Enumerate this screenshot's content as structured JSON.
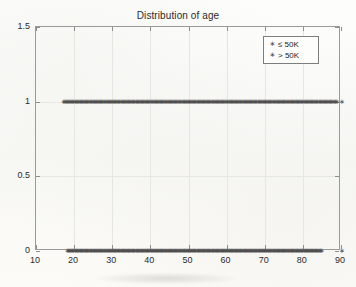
{
  "chart_data": {
    "type": "scatter",
    "title": "Distribution of age",
    "xlabel": "",
    "ylabel": "",
    "xlim": [
      10,
      90
    ],
    "ylim": [
      0,
      1.5
    ],
    "xticks": [
      10,
      20,
      30,
      40,
      50,
      60,
      70,
      80,
      90
    ],
    "yticks": [
      0,
      0.5,
      1,
      1.5
    ],
    "xtick_labels": [
      "10",
      "20",
      "30",
      "40",
      "50",
      "60",
      "70",
      "80",
      "90"
    ],
    "ytick_labels": [
      "0",
      "0.5",
      "1",
      "1.5"
    ],
    "grid": true,
    "legend_position": "top-right",
    "marker": "asterisk",
    "marker_color": "#4c4c4c",
    "series": [
      {
        "name": "≤ 50K",
        "y_value": 1,
        "x": [
          17,
          18,
          19,
          20,
          21,
          22,
          23,
          24,
          25,
          26,
          27,
          28,
          29,
          30,
          31,
          32,
          33,
          34,
          35,
          36,
          37,
          38,
          39,
          40,
          41,
          42,
          43,
          44,
          45,
          46,
          47,
          48,
          49,
          50,
          51,
          52,
          53,
          54,
          55,
          56,
          57,
          58,
          59,
          60,
          61,
          62,
          63,
          64,
          65,
          66,
          67,
          68,
          69,
          70,
          71,
          72,
          73,
          74,
          75,
          76,
          77,
          78,
          79,
          80,
          81,
          82,
          83,
          84,
          85,
          86,
          87,
          88,
          90
        ],
        "values": [
          1,
          1,
          1,
          1,
          1,
          1,
          1,
          1,
          1,
          1,
          1,
          1,
          1,
          1,
          1,
          1,
          1,
          1,
          1,
          1,
          1,
          1,
          1,
          1,
          1,
          1,
          1,
          1,
          1,
          1,
          1,
          1,
          1,
          1,
          1,
          1,
          1,
          1,
          1,
          1,
          1,
          1,
          1,
          1,
          1,
          1,
          1,
          1,
          1,
          1,
          1,
          1,
          1,
          1,
          1,
          1,
          1,
          1,
          1,
          1,
          1,
          1,
          1,
          1,
          1,
          1,
          1,
          1,
          1,
          1,
          1,
          1,
          1
        ]
      },
      {
        "name": "> 50K",
        "y_value": 0,
        "x": [
          18,
          19,
          20,
          21,
          22,
          23,
          24,
          25,
          26,
          27,
          28,
          29,
          30,
          31,
          32,
          33,
          34,
          35,
          36,
          37,
          38,
          39,
          40,
          41,
          42,
          43,
          44,
          45,
          46,
          47,
          48,
          49,
          50,
          51,
          52,
          53,
          54,
          55,
          56,
          57,
          58,
          59,
          60,
          61,
          62,
          63,
          64,
          65,
          66,
          67,
          68,
          69,
          70,
          71,
          72,
          73,
          74,
          75,
          76,
          77,
          78,
          79,
          80,
          81,
          82,
          83,
          84,
          90
        ],
        "values": [
          0,
          0,
          0,
          0,
          0,
          0,
          0,
          0,
          0,
          0,
          0,
          0,
          0,
          0,
          0,
          0,
          0,
          0,
          0,
          0,
          0,
          0,
          0,
          0,
          0,
          0,
          0,
          0,
          0,
          0,
          0,
          0,
          0,
          0,
          0,
          0,
          0,
          0,
          0,
          0,
          0,
          0,
          0,
          0,
          0,
          0,
          0,
          0,
          0,
          0,
          0,
          0,
          0,
          0,
          0,
          0,
          0,
          0,
          0,
          0,
          0,
          0,
          0,
          0,
          0,
          0,
          0,
          0
        ]
      }
    ]
  },
  "legend": {
    "items": [
      {
        "label": "≤ 50K",
        "marker": "asterisk-icon"
      },
      {
        "label": "> 50K",
        "marker": "asterisk-icon"
      }
    ]
  }
}
